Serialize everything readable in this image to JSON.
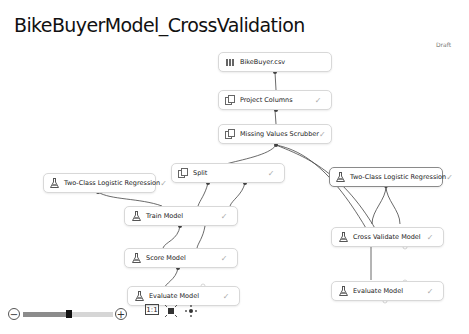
{
  "experiment": {
    "title": "BikeBuyerModel_CrossValidation",
    "status": "Draft"
  },
  "nodes": [
    {
      "id": "bikebuyer",
      "label": "BikeBuyer.csv",
      "icon": "dataset-icon",
      "checked": false
    },
    {
      "id": "project",
      "label": "Project Columns",
      "icon": "module-icon",
      "checked": true
    },
    {
      "id": "scrubber",
      "label": "Missing Values Scrubber",
      "icon": "module-icon",
      "checked": true
    },
    {
      "id": "split",
      "label": "Split",
      "icon": "module-icon",
      "checked": true
    },
    {
      "id": "lr_left",
      "label": "Two-Class Logistic Regression",
      "icon": "flask-icon",
      "checked": true
    },
    {
      "id": "lr_right",
      "label": "Two-Class Logistic Regression",
      "icon": "flask-icon",
      "checked": true
    },
    {
      "id": "train",
      "label": "Train Model",
      "icon": "flask-icon",
      "checked": true
    },
    {
      "id": "score",
      "label": "Score Model",
      "icon": "flask-icon",
      "checked": true
    },
    {
      "id": "eval_left",
      "label": "Evaluate Model",
      "icon": "flask-icon",
      "checked": true
    },
    {
      "id": "crossval",
      "label": "Cross Validate Model",
      "icon": "flask-icon",
      "checked": true
    },
    {
      "id": "eval_right",
      "label": "Evaluate Model",
      "icon": "flask-icon",
      "checked": true
    }
  ],
  "check_glyph": "✓",
  "zoom_controls": {
    "zoom_out": "−",
    "zoom_in": "+",
    "actual_size": "1:1"
  }
}
